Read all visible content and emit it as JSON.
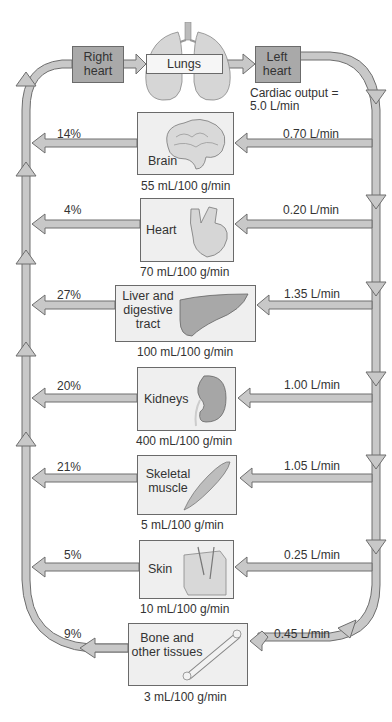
{
  "top": {
    "right_heart": "Right heart",
    "lungs": "Lungs",
    "left_heart": "Left heart",
    "cardiac_output_line1": "Cardiac output =",
    "cardiac_output_line2": "5.0 L/min"
  },
  "organs": [
    {
      "name": "Brain",
      "flow": "0.70 L/min",
      "percent": "14%",
      "perfusion": "55 mL/100 g/min",
      "icon": "brain-icon"
    },
    {
      "name": "Heart",
      "flow": "0.20 L/min",
      "percent": "4%",
      "perfusion": "70 mL/100 g/min",
      "icon": "heart-icon"
    },
    {
      "name": "Liver and digestive tract",
      "name_lines": [
        "Liver and",
        "digestive",
        "tract"
      ],
      "flow": "1.35 L/min",
      "percent": "27%",
      "perfusion": "100 mL/100 g/min",
      "icon": "liver-icon"
    },
    {
      "name": "Kidneys",
      "flow": "1.00 L/min",
      "percent": "20%",
      "perfusion": "400 mL/100 g/min",
      "icon": "kidney-icon"
    },
    {
      "name": "Skeletal muscle",
      "name_lines": [
        "Skeletal",
        "muscle"
      ],
      "flow": "1.05 L/min",
      "percent": "21%",
      "perfusion": "5 mL/100 g/min",
      "icon": "muscle-icon"
    },
    {
      "name": "Skin",
      "flow": "0.25 L/min",
      "percent": "5%",
      "perfusion": "10 mL/100 g/min",
      "icon": "skin-icon"
    },
    {
      "name": "Bone and other tissues",
      "name_lines": [
        "Bone and",
        "other tissues"
      ],
      "flow": "0.45 L/min",
      "percent": "9%",
      "perfusion": "3 mL/100 g/min",
      "icon": "bone-icon"
    }
  ],
  "colors": {
    "pipe": "#c8c8c8",
    "pipe_outline": "#6e6e6e",
    "box_dark": "#a9a9a9",
    "box_light": "#efefef"
  }
}
